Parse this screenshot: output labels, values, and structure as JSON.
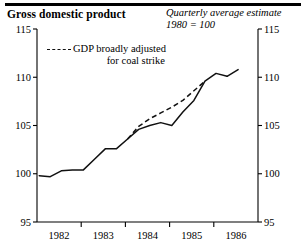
{
  "header": {
    "title": "Gross domestic product",
    "subtitle_line1": "Quarterly average estimate",
    "subtitle_line2": "1980 = 100"
  },
  "legend": {
    "dash_icon": "dashed-line-swatch",
    "label_line1": "GDP broadly adjusted",
    "label_line2": "for coal strike"
  },
  "chart_data": {
    "type": "line",
    "title": "Gross domestic product",
    "subtitle": "Quarterly average estimate, 1980 = 100",
    "xlabel": "",
    "ylabel": "",
    "index_base": "1980 = 100",
    "grid": false,
    "legend_position": "top-left",
    "xlim": [
      1981.5,
      1986.5
    ],
    "ylim": [
      95,
      115
    ],
    "y_ticks": [
      95,
      100,
      105,
      110,
      115
    ],
    "y_ticks_right": [
      95,
      100,
      105,
      110,
      115
    ],
    "x_tick_labels": [
      "1982",
      "1983",
      "1984",
      "1985",
      "1986"
    ],
    "x_tick_label_positions": [
      1982,
      1983,
      1984,
      1985,
      1986
    ],
    "x_tick_marks": [
      1982.5,
      1983.5,
      1984.5,
      1985.5
    ],
    "series": [
      {
        "name": "GDP",
        "style": "solid",
        "x": [
          1981.55,
          1981.8,
          1982.05,
          1982.3,
          1982.55,
          1982.8,
          1983.05,
          1983.3,
          1983.55,
          1983.8,
          1984.05,
          1984.3,
          1984.55,
          1984.8,
          1985.05,
          1985.3,
          1985.55,
          1985.8
        ],
        "values": [
          99.8,
          99.7,
          100.3,
          100.4,
          100.4,
          101.5,
          102.6,
          102.6,
          103.6,
          104.6,
          105.0,
          105.3,
          105.0,
          106.4,
          107.6,
          109.6,
          110.4,
          110.1
        ]
      },
      {
        "name": "GDP broadly adjusted for coal strike",
        "style": "dashed",
        "x": [
          1983.55,
          1983.8,
          1984.05,
          1984.3,
          1984.55,
          1984.8,
          1985.05,
          1985.3
        ],
        "values": [
          103.6,
          104.9,
          105.7,
          106.3,
          106.9,
          107.6,
          108.6,
          109.6
        ]
      },
      {
        "name": "GDP end segment",
        "style": "solid",
        "x": [
          1985.8,
          1986.05
        ],
        "values": [
          110.1,
          110.8
        ]
      }
    ]
  }
}
